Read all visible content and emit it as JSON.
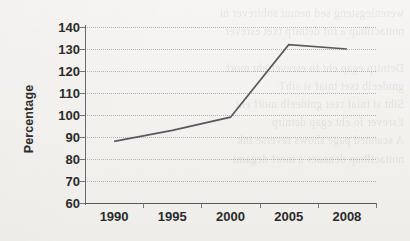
{
  "chart_data": {
    "type": "line",
    "title": "",
    "xlabel": "",
    "ylabel": "Percentage",
    "categories": [
      "1990",
      "1995",
      "2000",
      "2005",
      "2008"
    ],
    "series": [
      {
        "name": "Percentage",
        "values": [
          88,
          93,
          99,
          132,
          130
        ],
        "color": "#5a5a5a"
      }
    ],
    "ylim": [
      60,
      140
    ],
    "ytick_step": 10,
    "yticks": [
      60,
      70,
      80,
      90,
      100,
      110,
      120,
      130,
      140
    ],
    "ytick_labels": [
      "60",
      "70",
      "80",
      "90",
      "100",
      "110",
      "120",
      "130",
      "140"
    ],
    "grid": true,
    "grid_axis": "y",
    "grid_style": "dotted",
    "legend": false,
    "legend_position": "none",
    "markers": false,
    "background_color": "#f4f3f1",
    "axis_color": "#6b6b6b",
    "text_color": "#2b2b2b"
  },
  "scan_artifact": {
    "bleed_through_text": "wereniegsteng sed nemut sobirever ni\nnoitacilbup a rof detnirp txet esrever\n\nDetnirp egap eht fo esrever eht morf\ngnideelb txet tniaf si sihT\nSiht si tniaf txet gnideelb morf eht\nEsrever fo eht egap detnirp\nA scanned page shows reverse ink\nnoitacilbup dennacs a morf degami"
  }
}
